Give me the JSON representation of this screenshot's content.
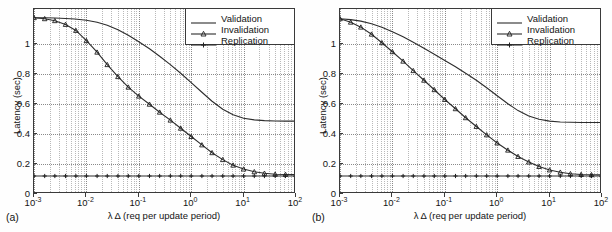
{
  "figure": {
    "panels": [
      {
        "label": "(a)",
        "axes": {
          "xlabel": "λ Δ (req per update period)",
          "ylabel": "Latency (sec)",
          "xticks": [
            "10",
            "10",
            "10",
            "10",
            "10",
            "10"
          ],
          "xtick_exponents": [
            "-3",
            "-2",
            "-1",
            "0",
            "1",
            "2"
          ],
          "yticks": [
            "0",
            "0.2",
            "0.4",
            "0.6",
            "0.8",
            "1"
          ]
        },
        "legend": {
          "items": [
            {
              "label": "Validation",
              "style": "line",
              "marker": "none",
              "color": "#3a3a3a"
            },
            {
              "label": "Invalidation",
              "style": "line",
              "marker": "triangle",
              "color": "#2b2b2b"
            },
            {
              "label": "Replication",
              "style": "line",
              "marker": "plus",
              "color": "#2b2b2b"
            }
          ]
        }
      },
      {
        "label": "(b)",
        "axes": {
          "xlabel": "λ Δ (req per update period)",
          "ylabel": "Latency (sec)",
          "xticks": [
            "10",
            "10",
            "10",
            "10",
            "10",
            "10"
          ],
          "xtick_exponents": [
            "-3",
            "-2",
            "-1",
            "0",
            "1",
            "2"
          ],
          "yticks": [
            "0",
            "0.2",
            "0.4",
            "0.6",
            "0.8",
            "1"
          ]
        },
        "legend": {
          "items": [
            {
              "label": "Validation",
              "style": "line",
              "marker": "none",
              "color": "#3a3a3a"
            },
            {
              "label": "Invalidation",
              "style": "line",
              "marker": "triangle",
              "color": "#2b2b2b"
            },
            {
              "label": "Replication",
              "style": "line",
              "marker": "plus",
              "color": "#2b2b2b"
            }
          ]
        }
      }
    ]
  },
  "chart_data": [
    {
      "type": "line",
      "panel": "(a)",
      "title": "",
      "xlabel": "λ Δ (req per update period)",
      "ylabel": "Latency (sec)",
      "xscale": "log",
      "xlim": [
        0.001,
        100
      ],
      "ylim": [
        0,
        1.233
      ],
      "yticks": [
        0,
        0.2,
        0.4,
        0.6,
        0.8,
        1
      ],
      "xticks": [
        0.001,
        0.01,
        0.1,
        1,
        10,
        100
      ],
      "grid": true,
      "legend_position": "upper right",
      "series": [
        {
          "name": "Validation",
          "marker": "none",
          "x": [
            0.001,
            0.0015,
            0.0025,
            0.004,
            0.006,
            0.01,
            0.016,
            0.025,
            0.04,
            0.063,
            0.1,
            0.16,
            0.25,
            0.4,
            0.63,
            1.0,
            1.6,
            2.5,
            4.0,
            6.3,
            10,
            16,
            25,
            40,
            63,
            100
          ],
          "y": [
            1.175,
            1.175,
            1.173,
            1.17,
            1.166,
            1.158,
            1.145,
            1.125,
            1.095,
            1.058,
            1.015,
            0.968,
            0.918,
            0.862,
            0.805,
            0.742,
            0.678,
            0.618,
            0.565,
            0.528,
            0.505,
            0.494,
            0.489,
            0.487,
            0.486,
            0.486
          ]
        },
        {
          "name": "Invalidation",
          "marker": "triangle",
          "x": [
            0.001,
            0.0016,
            0.0025,
            0.004,
            0.0063,
            0.01,
            0.016,
            0.025,
            0.04,
            0.063,
            0.1,
            0.16,
            0.25,
            0.4,
            0.63,
            1.0,
            1.6,
            2.5,
            4.0,
            6.3,
            10,
            16,
            25,
            40,
            63,
            100
          ],
          "y": [
            1.175,
            1.168,
            1.155,
            1.13,
            1.09,
            1.022,
            0.945,
            0.862,
            0.782,
            0.712,
            0.652,
            0.598,
            0.545,
            0.492,
            0.438,
            0.383,
            0.327,
            0.275,
            0.229,
            0.192,
            0.166,
            0.148,
            0.138,
            0.132,
            0.13,
            0.129
          ]
        },
        {
          "name": "Replication",
          "marker": "plus",
          "x": [
            0.001,
            0.0016,
            0.0025,
            0.004,
            0.0063,
            0.01,
            0.016,
            0.025,
            0.04,
            0.063,
            0.1,
            0.16,
            0.25,
            0.4,
            0.63,
            1.0,
            1.6,
            2.5,
            4.0,
            6.3,
            10,
            16,
            25,
            40,
            63,
            100
          ],
          "y": [
            0.12,
            0.12,
            0.12,
            0.12,
            0.12,
            0.12,
            0.12,
            0.12,
            0.12,
            0.12,
            0.12,
            0.12,
            0.12,
            0.12,
            0.12,
            0.12,
            0.12,
            0.12,
            0.12,
            0.12,
            0.12,
            0.12,
            0.12,
            0.12,
            0.12,
            0.12
          ]
        }
      ]
    },
    {
      "type": "line",
      "panel": "(b)",
      "title": "",
      "xlabel": "λ Δ (req per update period)",
      "ylabel": "Latency (sec)",
      "xscale": "log",
      "xlim": [
        0.001,
        100
      ],
      "ylim": [
        0,
        1.233
      ],
      "yticks": [
        0,
        0.2,
        0.4,
        0.6,
        0.8,
        1
      ],
      "xticks": [
        0.001,
        0.01,
        0.1,
        1,
        10,
        100
      ],
      "grid": true,
      "legend_position": "upper right",
      "series": [
        {
          "name": "Validation",
          "marker": "none",
          "x": [
            0.001,
            0.0016,
            0.0025,
            0.004,
            0.0063,
            0.01,
            0.016,
            0.025,
            0.04,
            0.063,
            0.1,
            0.16,
            0.25,
            0.4,
            0.63,
            1.0,
            1.6,
            2.5,
            4.0,
            6.3,
            10,
            16,
            25,
            40,
            63,
            100
          ],
          "y": [
            1.168,
            1.162,
            1.152,
            1.135,
            1.112,
            1.082,
            1.048,
            1.012,
            0.972,
            0.932,
            0.89,
            0.848,
            0.805,
            0.758,
            0.708,
            0.655,
            0.602,
            0.556,
            0.52,
            0.498,
            0.486,
            0.48,
            0.478,
            0.477,
            0.477,
            0.477
          ]
        },
        {
          "name": "Invalidation",
          "marker": "triangle",
          "x": [
            0.001,
            0.0016,
            0.0025,
            0.004,
            0.0063,
            0.01,
            0.016,
            0.025,
            0.04,
            0.063,
            0.1,
            0.16,
            0.25,
            0.4,
            0.63,
            1.0,
            1.6,
            2.5,
            4.0,
            6.3,
            10,
            16,
            25,
            40,
            63,
            100
          ],
          "y": [
            1.168,
            1.145,
            1.112,
            1.065,
            1.008,
            0.948,
            0.885,
            0.822,
            0.758,
            0.695,
            0.63,
            0.568,
            0.508,
            0.45,
            0.394,
            0.34,
            0.292,
            0.25,
            0.213,
            0.183,
            0.16,
            0.145,
            0.135,
            0.13,
            0.128,
            0.127
          ]
        },
        {
          "name": "Replication",
          "marker": "plus",
          "x": [
            0.001,
            0.0016,
            0.0025,
            0.004,
            0.0063,
            0.01,
            0.016,
            0.025,
            0.04,
            0.063,
            0.1,
            0.16,
            0.25,
            0.4,
            0.63,
            1.0,
            1.6,
            2.5,
            4.0,
            6.3,
            10,
            16,
            25,
            40,
            63,
            100
          ],
          "y": [
            0.12,
            0.12,
            0.12,
            0.12,
            0.12,
            0.12,
            0.12,
            0.12,
            0.12,
            0.12,
            0.12,
            0.12,
            0.12,
            0.12,
            0.12,
            0.12,
            0.12,
            0.12,
            0.12,
            0.12,
            0.12,
            0.12,
            0.12,
            0.12,
            0.12,
            0.12
          ]
        }
      ]
    }
  ]
}
